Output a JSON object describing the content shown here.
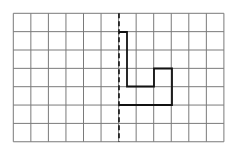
{
  "diagram": {
    "type": "grid-reflection",
    "grid": {
      "origin": [
        13.3,
        13.3
      ],
      "columns": 12,
      "rows": 7,
      "cell_width": 17.55,
      "cell_height": 18.35,
      "line_color": "#7a7a7a",
      "line_width": 1
    },
    "mirror_line": {
      "style": "dashed",
      "x": 119,
      "y_start": 13.3,
      "y_end": 141.7,
      "color": "#111111",
      "width": 1.6,
      "dash": "5,3"
    },
    "shape": {
      "description": "L-shaped polygon adjacent to right of mirror line",
      "points": [
        [
          119,
          32
        ],
        [
          127,
          32
        ],
        [
          127,
          86.5
        ],
        [
          154,
          86.5
        ],
        [
          154,
          68.5
        ],
        [
          172,
          68.5
        ],
        [
          172,
          105
        ],
        [
          119,
          105
        ]
      ],
      "stroke": "#111111",
      "stroke_width": 1.8,
      "closed": false
    }
  }
}
